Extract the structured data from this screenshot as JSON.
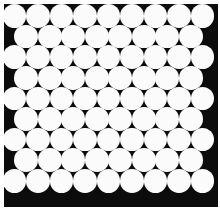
{
  "figure": {
    "title": "Hexagonal close-packed circle array",
    "description": "Monochrome micrograph-style image: white circles in a hexagonal close packing on a black background",
    "alt_text": "Dense hexagonal packing of equal white discs on a black field"
  },
  "canvas": {
    "width": 220,
    "height": 210,
    "page_background": "#ffffff",
    "margin_left": 4,
    "margin_top": 4,
    "margin_right": 2,
    "margin_bottom": 3
  },
  "field": {
    "background": "#0c0c0c",
    "x": 4,
    "y": 4,
    "width": 214,
    "height": 203
  },
  "lattice": {
    "type": "hexagonal-close-packed",
    "circle_fill": "#fbfbfb",
    "circle_diameter": 23.6,
    "pitch_x": 23.5,
    "pitch_y": 20.6,
    "row_offset_x": 11.75,
    "origin_x": 14.5,
    "origin_y": 16.0,
    "row_count": 9,
    "counts_per_row": [
      9,
      8,
      9,
      8,
      9,
      8,
      9,
      8,
      9
    ],
    "total_circles": 77,
    "offset_rows": [
      2,
      4,
      6,
      8
    ],
    "edge_clipping": "right and bottom rows are clipped by the field boundary"
  },
  "palette": {
    "black": "#0c0c0c",
    "white": "#fbfbfb",
    "page": "#ffffff"
  }
}
